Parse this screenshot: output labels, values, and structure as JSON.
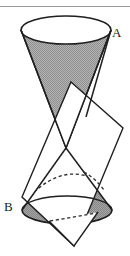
{
  "figure": {
    "kind": "geometry-diagram",
    "background_color": "#ffffff",
    "top_rule": {
      "name": "horizontal-rule",
      "color": "#9a9a9a",
      "y": 6,
      "x_start": 0,
      "x_end": 130,
      "thickness": 1
    },
    "labels": [
      {
        "id": "A",
        "text": "A",
        "x": 112,
        "y": 37,
        "anchor": "vertex-upper"
      },
      {
        "id": "B",
        "text": "B",
        "x": 4,
        "y": 211,
        "anchor": "vertex-lower"
      }
    ],
    "colors": {
      "outline": "#1f1f1f",
      "shading_gray": "#a9a9a9",
      "shading_gray_dark": "#9b9b9b",
      "plane_fill": "#ffffff",
      "ellipse_top_fill": "#ffffff",
      "hidden_line": "#2a2a2a",
      "rule_gray": "#9a9a9a"
    },
    "geometry": {
      "upper_cone": {
        "name": "upper-cone",
        "apex": {
          "x": 66,
          "y": 148
        },
        "base_ellipse": {
          "cx": 66,
          "cy": 30,
          "rx": 45,
          "ry": 14
        },
        "fill": "shaded",
        "base_fill": "white"
      },
      "lower_cone": {
        "name": "lower-cone",
        "apex": {
          "x": 66,
          "y": 148
        },
        "base_ellipse": {
          "cx": 67,
          "cy": 210,
          "rx": 45,
          "ry": 14
        },
        "fill": "shaded",
        "base_fill": "shaded"
      },
      "cutting_plane": {
        "name": "cutting-plane",
        "shape": "parallelogram",
        "fill": "#ffffff",
        "stroke": "#1f1f1f",
        "corners": [
          {
            "x": 71,
            "y": 82
          },
          {
            "x": 123,
            "y": 128
          },
          {
            "x": 74,
            "y": 246
          },
          {
            "x": 22,
            "y": 197
          }
        ]
      },
      "conic_section": {
        "name": "conic-section-curve",
        "style": "dashed-hidden-and-solid-visible",
        "type": "ellipse-arc"
      }
    }
  }
}
